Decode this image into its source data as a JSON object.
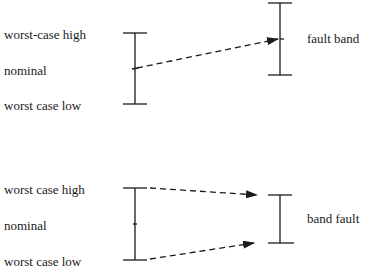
{
  "diagrams": [
    {
      "id": "top",
      "left_labels": {
        "high": "worst-case high",
        "nominal": "nominal",
        "low": "worst case low"
      },
      "right_label": "fault band",
      "arrows": [
        {
          "from": "nominal",
          "to": "fault band midpoint",
          "style": "dashed"
        }
      ]
    },
    {
      "id": "bottom",
      "left_labels": {
        "high": "worst case high",
        "nominal": "nominal",
        "low": "worst case low"
      },
      "right_label": "band fault",
      "arrows": [
        {
          "from": "worst case high",
          "to": "band fault top",
          "style": "dashed"
        },
        {
          "from": "worst case low",
          "to": "band fault bottom",
          "style": "dashed"
        }
      ]
    }
  ],
  "colors": {
    "line": "#1a1a1a",
    "background": "#ffffff"
  }
}
